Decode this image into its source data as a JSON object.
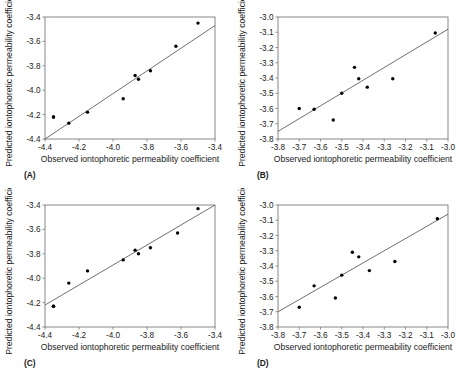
{
  "figure": {
    "axis_titles": {
      "x": "Observed iontophoretic permeability coefficient",
      "y": "Predicted iontophoretic permeability coefficient"
    }
  },
  "chart_data": [
    {
      "type": "scatter",
      "panel": "(A)",
      "title": "",
      "xlabel": "Observed iontophoretic permeability coefficient",
      "ylabel": "Predicted iontophoretic permeability coefficient",
      "xlim": [
        -4.4,
        -3.4
      ],
      "ylim": [
        -4.4,
        -3.4
      ],
      "xticks": [
        -4.4,
        -4.2,
        -4.0,
        -3.8,
        -3.6,
        -3.4
      ],
      "xtick_labels": [
        "-4.4",
        "-4.2",
        "-4.0",
        "-3.8",
        "-3.6",
        "-3.4"
      ],
      "yticks": [
        -3.4,
        -3.6,
        -3.8,
        -4.0,
        -4.2,
        -4.4
      ],
      "ytick_labels": [
        "-3.4",
        "-3.6",
        "-3.8",
        "-4.0",
        "-4.2",
        "-4.4"
      ],
      "grid": false,
      "legend": "none",
      "x": [
        -4.35,
        -4.26,
        -4.15,
        -3.94,
        -3.87,
        -3.85,
        -3.78,
        -3.63,
        -3.5,
        -4.35
      ],
      "y": [
        -4.22,
        -4.27,
        -4.18,
        -4.07,
        -3.88,
        -3.91,
        -3.84,
        -3.64,
        -3.45,
        -4.22
      ],
      "fit_line": {
        "x": [
          -4.4,
          -3.4
        ],
        "y": [
          -4.4,
          -3.47
        ]
      }
    },
    {
      "type": "scatter",
      "panel": "(B)",
      "title": "",
      "xlabel": "Observed iontophoretic permeability coefficient",
      "ylabel": "Predicted iontophoretic permeability coefficient",
      "xlim": [
        -3.8,
        -3.0
      ],
      "ylim": [
        -3.8,
        -3.0
      ],
      "xticks": [
        -3.8,
        -3.7,
        -3.6,
        -3.5,
        -3.4,
        -3.3,
        -3.2,
        -3.1,
        -3.0
      ],
      "xtick_labels": [
        "-3.8",
        "-3.7",
        "-3.6",
        "-3.5",
        "-3.4",
        "-3.3",
        "-3.2",
        "-3.1",
        "-3.0"
      ],
      "yticks": [
        -3.0,
        -3.1,
        -3.2,
        -3.3,
        -3.4,
        -3.5,
        -3.6,
        -3.7,
        -3.8
      ],
      "ytick_labels": [
        "-3.0",
        "-3.1",
        "-3.2",
        "-3.3",
        "-3.4",
        "-3.5",
        "-3.6",
        "-3.7",
        "-3.8"
      ],
      "grid": false,
      "legend": "none",
      "x": [
        -3.7,
        -3.63,
        -3.54,
        -3.5,
        -3.44,
        -3.42,
        -3.38,
        -3.26,
        -3.06
      ],
      "y": [
        -3.6,
        -3.605,
        -3.675,
        -3.5,
        -3.33,
        -3.405,
        -3.46,
        -3.405,
        -3.105
      ],
      "fit_line": {
        "x": [
          -3.8,
          -3.0
        ],
        "y": [
          -3.75,
          -3.08
        ]
      }
    },
    {
      "type": "scatter",
      "panel": "(C)",
      "title": "",
      "xlabel": "Observed iontophoretic permeability coefficient",
      "ylabel": "Predicted iontophoretic permeability coefficient",
      "xlim": [
        -4.4,
        -3.4
      ],
      "ylim": [
        -4.4,
        -3.4
      ],
      "xticks": [
        -4.4,
        -4.2,
        -4.0,
        -3.8,
        -3.6,
        -3.4
      ],
      "xtick_labels": [
        "-4.4",
        "-4.2",
        "-4.0",
        "-3.8",
        "-3.6",
        "-3.4"
      ],
      "yticks": [
        -3.4,
        -3.6,
        -3.8,
        -4.0,
        -4.2,
        -4.4
      ],
      "ytick_labels": [
        "-3.4",
        "-3.6",
        "-3.8",
        "-4.0",
        "-4.2",
        "-4.4"
      ],
      "grid": false,
      "legend": "none",
      "x": [
        -4.35,
        -4.26,
        -4.15,
        -3.94,
        -3.87,
        -3.85,
        -3.78,
        -3.62,
        -3.5,
        -4.35
      ],
      "y": [
        -4.23,
        -4.04,
        -3.94,
        -3.85,
        -3.77,
        -3.8,
        -3.75,
        -3.63,
        -3.43,
        -4.23
      ],
      "fit_line": {
        "x": [
          -4.4,
          -3.4
        ],
        "y": [
          -4.22,
          -3.4
        ]
      }
    },
    {
      "type": "scatter",
      "panel": "(D)",
      "title": "",
      "xlabel": "Observed iontophoretic permeability coefficient",
      "ylabel": "Predicted iontophoretic permeability coefficient",
      "xlim": [
        -3.8,
        -3.0
      ],
      "ylim": [
        -3.8,
        -3.0
      ],
      "xticks": [
        -3.8,
        -3.7,
        -3.6,
        -3.5,
        -3.4,
        -3.3,
        -3.2,
        -3.1,
        -3.0
      ],
      "xtick_labels": [
        "-3.8",
        "-3.7",
        "-3.6",
        "-3.5",
        "-3.4",
        "-3.3",
        "-3.2",
        "-3.1",
        "-3.0"
      ],
      "yticks": [
        -3.0,
        -3.1,
        -3.2,
        -3.3,
        -3.4,
        -3.5,
        -3.6,
        -3.7,
        -3.8
      ],
      "ytick_labels": [
        "-3.0",
        "-3.1",
        "-3.2",
        "-3.3",
        "-3.4",
        "-3.5",
        "-3.6",
        "-3.7",
        "-3.8"
      ],
      "grid": false,
      "legend": "none",
      "x": [
        -3.7,
        -3.63,
        -3.53,
        -3.5,
        -3.45,
        -3.42,
        -3.37,
        -3.25,
        -3.05
      ],
      "y": [
        -3.67,
        -3.53,
        -3.61,
        -3.46,
        -3.31,
        -3.34,
        -3.43,
        -3.37,
        -3.09
      ],
      "fit_line": {
        "x": [
          -3.8,
          -3.0
        ],
        "y": [
          -3.7,
          -3.06
        ]
      }
    }
  ]
}
